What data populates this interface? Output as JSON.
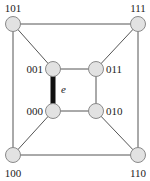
{
  "diagram": {
    "type": "hypercube-graph",
    "dimension": 3,
    "node_fill": "#e2e2e2",
    "node_stroke": "#8a8a8a",
    "edge_color": "#555555",
    "highlight_edge_color": "#111111",
    "nodes": [
      {
        "id": "101",
        "label": "101",
        "x": 13,
        "y": 24,
        "lx": 13,
        "ly": 12,
        "anchor": "middle"
      },
      {
        "id": "111",
        "label": "111",
        "x": 138,
        "y": 24,
        "lx": 138,
        "ly": 12,
        "anchor": "middle"
      },
      {
        "id": "001",
        "label": "001",
        "x": 53,
        "y": 69,
        "lx": 43,
        "ly": 73,
        "anchor": "end"
      },
      {
        "id": "011",
        "label": "011",
        "x": 96,
        "y": 69,
        "lx": 106,
        "ly": 73,
        "anchor": "start"
      },
      {
        "id": "000",
        "label": "000",
        "x": 53,
        "y": 111,
        "lx": 43,
        "ly": 115,
        "anchor": "end"
      },
      {
        "id": "010",
        "label": "010",
        "x": 96,
        "y": 111,
        "lx": 106,
        "ly": 115,
        "anchor": "start"
      },
      {
        "id": "100",
        "label": "100",
        "x": 13,
        "y": 155,
        "lx": 13,
        "ly": 177,
        "anchor": "middle"
      },
      {
        "id": "110",
        "label": "110",
        "x": 138,
        "y": 155,
        "lx": 138,
        "ly": 177,
        "anchor": "middle"
      }
    ],
    "edges": [
      {
        "from": "101",
        "to": "111"
      },
      {
        "from": "101",
        "to": "100"
      },
      {
        "from": "111",
        "to": "110"
      },
      {
        "from": "100",
        "to": "110"
      },
      {
        "from": "101",
        "to": "001"
      },
      {
        "from": "111",
        "to": "011"
      },
      {
        "from": "100",
        "to": "000"
      },
      {
        "from": "110",
        "to": "010"
      },
      {
        "from": "001",
        "to": "011"
      },
      {
        "from": "011",
        "to": "010"
      },
      {
        "from": "000",
        "to": "010"
      },
      {
        "from": "001",
        "to": "000",
        "highlight": true,
        "label": "e"
      }
    ],
    "highlighted_edge_label": "e"
  }
}
